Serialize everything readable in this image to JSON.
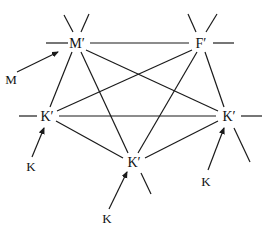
{
  "diagram": {
    "type": "graph",
    "nodes": [
      {
        "id": "M1",
        "label": "M′",
        "x": 77,
        "y": 43
      },
      {
        "id": "F1",
        "label": "F′",
        "x": 201,
        "y": 43
      },
      {
        "id": "K1",
        "label": "K′",
        "x": 46,
        "y": 116
      },
      {
        "id": "K2",
        "label": "K′",
        "x": 228,
        "y": 116
      },
      {
        "id": "K3",
        "label": "K′",
        "x": 133,
        "y": 162
      }
    ],
    "edges": [
      [
        "M1",
        "F1"
      ],
      [
        "M1",
        "K1"
      ],
      [
        "M1",
        "K2"
      ],
      [
        "M1",
        "K3"
      ],
      [
        "F1",
        "K1"
      ],
      [
        "F1",
        "K2"
      ],
      [
        "F1",
        "K3"
      ],
      [
        "K1",
        "K2"
      ],
      [
        "K1",
        "K3"
      ],
      [
        "K2",
        "K3"
      ]
    ],
    "inputs": [
      {
        "label": "M",
        "x": 11,
        "y": 80,
        "target": "M1"
      },
      {
        "label": "K",
        "x": 31,
        "y": 168,
        "target": "K1"
      },
      {
        "label": "K",
        "x": 107,
        "y": 220,
        "target": "K3"
      },
      {
        "label": "K",
        "x": 206,
        "y": 183,
        "target": "K2"
      }
    ],
    "colors": {
      "stroke": "#1a1a1a",
      "background": "#ffffff"
    }
  }
}
